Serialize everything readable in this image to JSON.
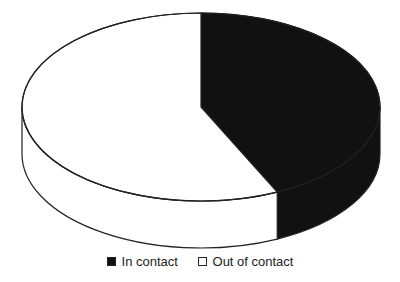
{
  "chart_data": {
    "type": "pie",
    "style": "3d-pie",
    "title": "",
    "categories": [
      "In contact",
      "Out of contact"
    ],
    "values": [
      43,
      57
    ],
    "colors": [
      "#111111",
      "#ffffff"
    ],
    "legend_position": "bottom"
  },
  "legend": {
    "items": [
      {
        "label": "In contact",
        "color": "#111111"
      },
      {
        "label": "Out of contact",
        "color": "#ffffff"
      }
    ]
  }
}
